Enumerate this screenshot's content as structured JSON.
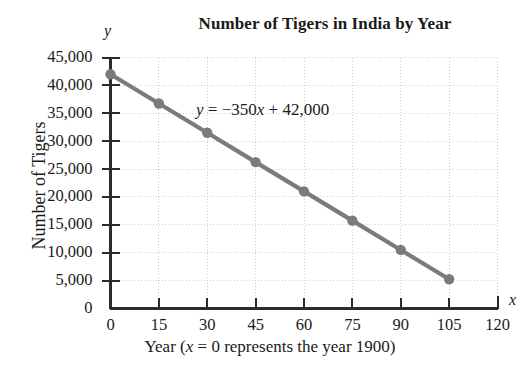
{
  "chart_data": {
    "type": "line",
    "title": "Number of Tigers in India by Year",
    "xlabel": "Year (x = 0 represents the year 1900)",
    "ylabel": "Number of Tigers",
    "x_axis_symbol": "x",
    "y_axis_symbol": "y",
    "annotation": "y = −350x + 42,000",
    "annotation_parts": {
      "lhs": "y",
      "equals": " = ",
      "slope": "−350",
      "var": "x",
      "plus": " + ",
      "intercept": "42,000"
    },
    "equation": {
      "slope": -350,
      "intercept": 42000
    },
    "x": [
      0,
      15,
      30,
      45,
      60,
      75,
      90,
      105
    ],
    "values": [
      42000,
      36750,
      31500,
      26250,
      21000,
      15750,
      10500,
      5250
    ],
    "xlim": [
      0,
      120
    ],
    "ylim": [
      0,
      45000
    ],
    "xticks": [
      "0",
      "15",
      "30",
      "45",
      "60",
      "75",
      "90",
      "105",
      "120"
    ],
    "xtick_values": [
      0,
      15,
      30,
      45,
      60,
      75,
      90,
      105,
      120
    ],
    "yticks": [
      "0",
      "5,000",
      "10,000",
      "15,000",
      "20,000",
      "25,000",
      "30,000",
      "35,000",
      "40,000",
      "45,000"
    ],
    "ytick_values": [
      0,
      5000,
      10000,
      15000,
      20000,
      25000,
      30000,
      35000,
      40000,
      45000
    ],
    "grid": true,
    "legend": false,
    "series_color": "#7b7b7b",
    "marker": "circle",
    "axis_color": "#2b2b2b",
    "grid_color": "#cfcfcf"
  }
}
